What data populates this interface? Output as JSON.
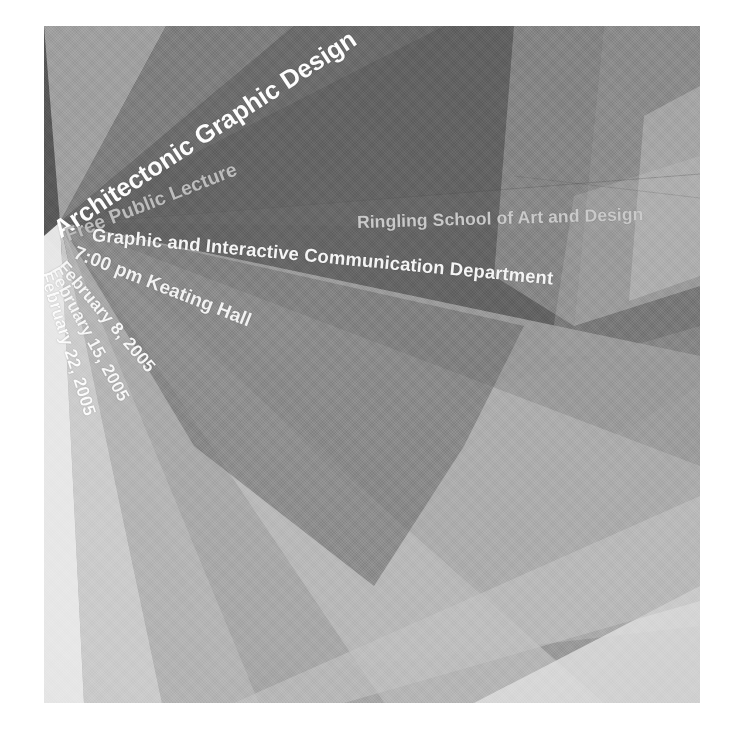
{
  "poster": {
    "title": "Architectonic Graphic Design",
    "subtitle": "Free Public Lecture",
    "school": "Ringling School of Art and Design",
    "department": "Graphic and Interactive Communication Department",
    "time_and_venue": "7:00 pm Keating Hall",
    "dates": [
      "February 8, 2005",
      "February 15, 2005",
      "February 22, 2005"
    ],
    "colors": {
      "page_background": "#ffffff",
      "darkest_wedge": "#4d4d4d",
      "dark_wedge": "#5a5a5a",
      "mid_dark_wedge": "#6e6e6e",
      "mid_wedge": "#8a8a8a",
      "light_mid_wedge": "#9e9e9e",
      "light_wedge": "#ababab",
      "lighter_wedge": "#c6c6c6",
      "lightest_wedge": "#e9e9e9",
      "title_text": "#fdfdfd",
      "subtitle_text": "#bcbcbc",
      "school_text": "#c9c9c9"
    }
  }
}
